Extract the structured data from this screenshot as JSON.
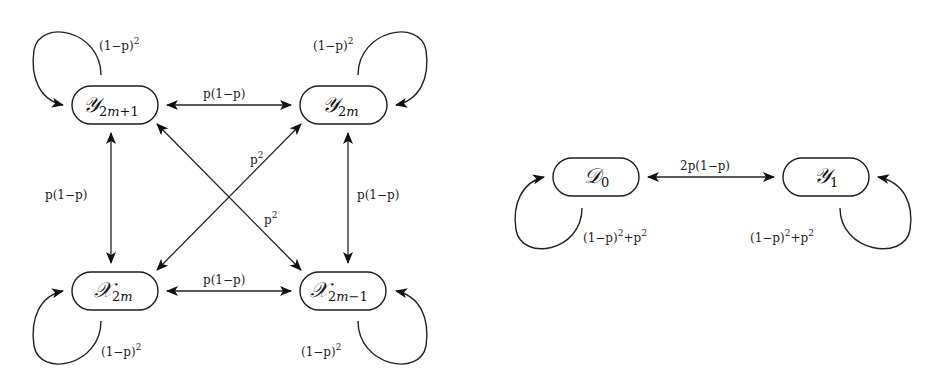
{
  "diagram": {
    "type": "markov-chain-state-transition",
    "left_chain": {
      "nodes": [
        {
          "id": "Y2m+1",
          "symbol": "𝒴",
          "subscript": "2m+1"
        },
        {
          "id": "Y2m",
          "symbol": "𝒴",
          "subscript": "2m"
        },
        {
          "id": "X2m",
          "symbol": "𝒳",
          "subscript": "2m"
        },
        {
          "id": "X2m-1",
          "symbol": "𝒳",
          "subscript": "2m−1"
        }
      ],
      "edges": [
        {
          "from": "Y2m+1",
          "to": "Y2m+1",
          "label": "(1−p)²",
          "kind": "self-loop"
        },
        {
          "from": "Y2m",
          "to": "Y2m",
          "label": "(1−p)²",
          "kind": "self-loop"
        },
        {
          "from": "X2m",
          "to": "X2m",
          "label": "(1−p)²",
          "kind": "self-loop"
        },
        {
          "from": "X2m-1",
          "to": "X2m-1",
          "label": "(1−p)²",
          "kind": "self-loop"
        },
        {
          "from": "Y2m+1",
          "to": "Y2m",
          "label": "p(1−p)",
          "kind": "bidirectional"
        },
        {
          "from": "X2m",
          "to": "X2m-1",
          "label": "p(1−p)",
          "kind": "bidirectional"
        },
        {
          "from": "Y2m+1",
          "to": "X2m",
          "label": "p(1−p)",
          "kind": "bidirectional"
        },
        {
          "from": "Y2m",
          "to": "X2m-1",
          "label": "p(1−p)",
          "kind": "bidirectional"
        },
        {
          "from": "Y2m",
          "to": "X2m",
          "label": "p²",
          "kind": "bidirectional"
        },
        {
          "from": "Y2m+1",
          "to": "X2m-1",
          "label": "p²",
          "kind": "bidirectional"
        }
      ]
    },
    "right_chain": {
      "nodes": [
        {
          "id": "D0",
          "symbol": "𝒟",
          "subscript": "0"
        },
        {
          "id": "Y1",
          "symbol": "𝒴",
          "subscript": "1"
        }
      ],
      "edges": [
        {
          "from": "D0",
          "to": "D0",
          "label": "(1−p)²+p²",
          "kind": "self-loop"
        },
        {
          "from": "Y1",
          "to": "Y1",
          "label": "(1−p)²+p²",
          "kind": "self-loop"
        },
        {
          "from": "D0",
          "to": "Y1",
          "label": "2p(1−p)",
          "kind": "bidirectional"
        }
      ]
    }
  },
  "labels": {
    "loop_sq": "(1−p)",
    "sq": "2",
    "p1p": "p(1−p)",
    "p": "p",
    "two_p1p": "2p(1−p)",
    "sum_a": "(1−p)",
    "sum_b": "+p"
  },
  "nodes": {
    "y2m1": {
      "sym": "𝒴",
      "sub": "2",
      "subi": "m",
      "subt": "+1"
    },
    "y2m": {
      "sym": "𝒴",
      "sub": "2",
      "subi": "m"
    },
    "x2m": {
      "sym": "𝒳",
      "sub": "2",
      "subi": "m"
    },
    "x2m1": {
      "sym": "𝒳",
      "sub": "2",
      "subi": "m",
      "subt": "−1"
    },
    "d0": {
      "sym": "𝒟",
      "sub": "0"
    },
    "y1": {
      "sym": "𝒴",
      "sub": "1"
    }
  }
}
